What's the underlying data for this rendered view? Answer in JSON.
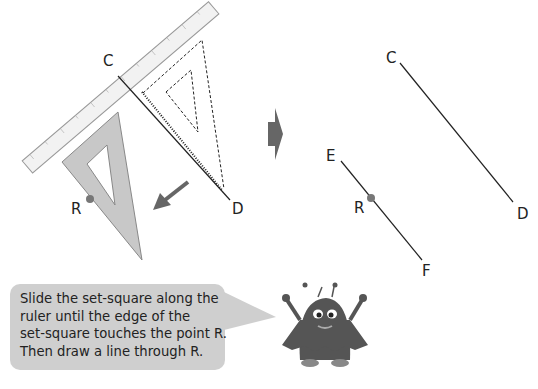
{
  "left_figure": {
    "labels": {
      "C": "C",
      "D": "D",
      "R": "R"
    },
    "ruler_ticks": [
      "0",
      "1",
      "2",
      "3",
      "4",
      "5",
      "6",
      "7",
      "8",
      "9",
      "10",
      "11"
    ]
  },
  "right_figure": {
    "labels": {
      "C": "C",
      "D": "D",
      "E": "E",
      "F": "F",
      "R": "R"
    }
  },
  "speech_bubble": {
    "lines": [
      "Slide the set-square along the",
      "ruler until the edge of the",
      "set-square touches the point R.",
      "Then draw a line through R."
    ]
  },
  "colors": {
    "set_square": "#c8c8c8",
    "arrow": "#666666",
    "bubble": "#cfcfcf",
    "monster": "#555555"
  }
}
